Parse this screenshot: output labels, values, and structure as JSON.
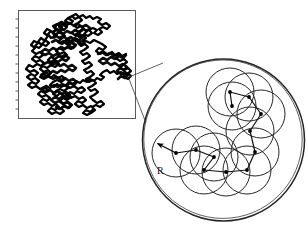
{
  "figure": {
    "name": "random-walk-coarse-graining-figure",
    "background_color": "#ffffff",
    "ink_color": "#000000",
    "line_color": "#1a1a1a"
  },
  "walk_panel": {
    "name": "random-walk-panel",
    "box": {
      "x": 18,
      "y": 10,
      "width": 117,
      "height": 108
    },
    "border_color": "#555555",
    "axis_color": "#444444",
    "tick_count_left": 12,
    "tick_length": 3,
    "trace_color": "#000000",
    "trace_width": 2.1
  },
  "magnifier": {
    "name": "magnifier-circle",
    "center": {
      "x": 223.5,
      "y": 140
    },
    "radius": 81,
    "outline_color": "#222222",
    "outline_width": 1.6,
    "source_point": {
      "x": 129,
      "y": 78
    },
    "leader_lines": [
      {
        "x1": 129,
        "y1": 77,
        "x2": 160,
        "y2": 64
      },
      {
        "x1": 129,
        "y1": 79,
        "x2": 147,
        "y2": 120
      }
    ],
    "leader_color": "#3a3a3a"
  },
  "inset": {
    "name": "coarse-grained-chain",
    "circle_radius": 24,
    "circle_stroke": "#222222",
    "circle_stroke_width": 1.0,
    "path_stroke": "#111111",
    "path_stroke_width": 1.2,
    "node_radius": 1.9,
    "node_color": "#000000",
    "centers": [
      {
        "x": 176,
        "y": 153
      },
      {
        "x": 196,
        "y": 150
      },
      {
        "x": 214,
        "y": 157
      },
      {
        "x": 204,
        "y": 170
      },
      {
        "x": 226,
        "y": 172
      },
      {
        "x": 247,
        "y": 170
      },
      {
        "x": 255,
        "y": 152
      },
      {
        "x": 250,
        "y": 131
      },
      {
        "x": 261,
        "y": 114
      },
      {
        "x": 249,
        "y": 97
      },
      {
        "x": 230,
        "y": 92
      },
      {
        "x": 232,
        "y": 106
      }
    ],
    "radius_label": "R",
    "radius_label_position": {
      "x": 159,
      "y": 166
    },
    "radius_arrow": {
      "from": {
        "x": 176,
        "y": 153
      },
      "to": {
        "x": 157,
        "y": 143
      }
    }
  }
}
